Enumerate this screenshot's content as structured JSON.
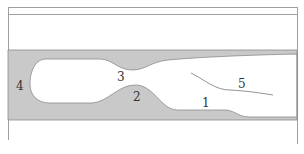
{
  "diagram": {
    "colors": {
      "fill": "#c8c8c8",
      "stroke": "#8a8a8a",
      "frame": "#9a9a9a",
      "background": "#ffffff",
      "text": "#333333"
    },
    "labels": [
      {
        "id": "1",
        "text": "1",
        "x": 205,
        "y": 107
      },
      {
        "id": "2",
        "text": "2",
        "x": 137,
        "y": 101
      },
      {
        "id": "3",
        "text": "3",
        "x": 121,
        "y": 81
      },
      {
        "id": "4",
        "text": "4",
        "x": 20,
        "y": 90
      },
      {
        "id": "5",
        "text": "5",
        "x": 241,
        "y": 88
      }
    ]
  }
}
